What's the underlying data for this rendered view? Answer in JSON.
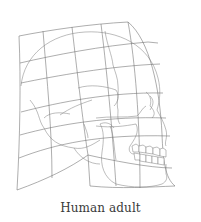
{
  "figure": {
    "caption": "Human adult",
    "colors": {
      "background": "#ffffff",
      "line": "#6a6a6a",
      "caption_text": "#3a3a3a"
    }
  }
}
